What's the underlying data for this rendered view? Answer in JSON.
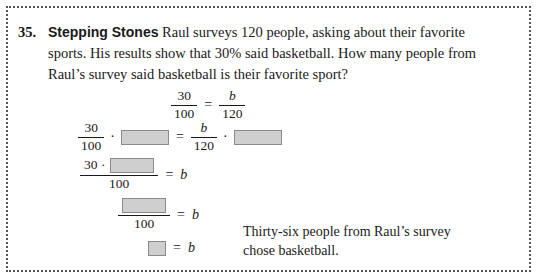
{
  "problem": {
    "number": "35.",
    "label": "Stepping Stones",
    "text": " Raul surveys 120 people, asking about their favorite sports. His results show that 30% said basketball. How many people from Raul’s survey said basketball is their favorite sport?"
  },
  "work": {
    "line1": {
      "left_num": "30",
      "left_den": "100",
      "equals": "=",
      "right_num": "b",
      "right_den": "120"
    },
    "line2": {
      "left_num": "30",
      "left_den": "100",
      "dot": "·",
      "blank1": "blank-box",
      "equals": "=",
      "right_num": "b",
      "right_den": "120",
      "dot2": "·",
      "blank2": "blank-box"
    },
    "line3": {
      "num_prefix": "30 ·",
      "blank": "blank-box",
      "den": "100",
      "equals": "=",
      "result": "b"
    },
    "line4": {
      "num_blank": "blank-box",
      "den": "100",
      "equals": "=",
      "result": "b"
    },
    "line5": {
      "blank": "blank-box",
      "equals": "=",
      "result": "b"
    }
  },
  "answer": {
    "line1": "Thirty-six people from Raul’s survey",
    "line2": "chose basketball."
  },
  "colors": {
    "blank_fill": "#cfcfcf",
    "blank_border": "#8a8a8a",
    "border": "#555555",
    "text": "#1a1a1a"
  }
}
